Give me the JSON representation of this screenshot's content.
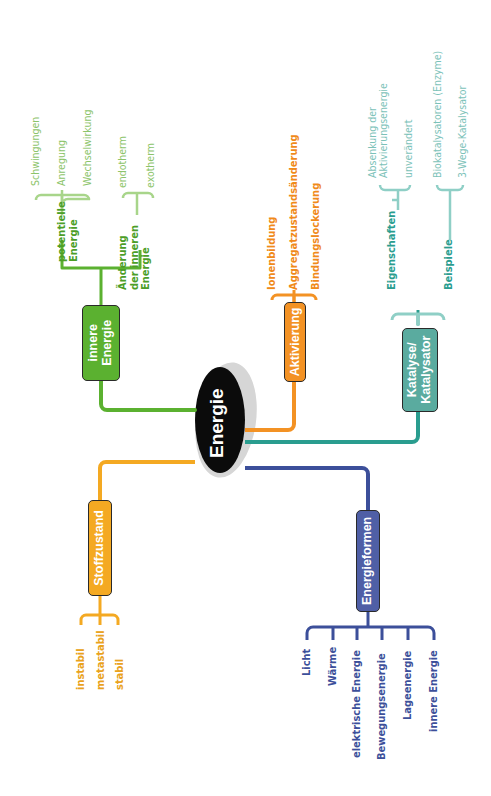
{
  "diagram": {
    "type": "mindmap",
    "orientation": "rotated-90-ccw",
    "center": {
      "label": "Energie",
      "color": "#111111"
    },
    "colors": {
      "innere_energie": "#5bb130",
      "innere_energie_light": "#a8d58a",
      "aktivierung": "#f39224",
      "stoffzustand": "#f4a922",
      "katalyse": "#2a9d8f",
      "katalyse_light": "#8fcfc6",
      "energieformen": "#3c4f9a"
    },
    "branches": [
      {
        "label": "innere Energie",
        "color": "#5bb130",
        "children": [
          {
            "label": "potentielle Energie",
            "children": [
              "Schwingungen",
              "Anregung",
              "Wechselwirkung"
            ]
          },
          {
            "label": "Änderung der inneren Energie",
            "children": [
              "endotherm",
              "exotherm"
            ]
          }
        ]
      },
      {
        "label": "Aktivierung",
        "color": "#f39224",
        "children": [
          {
            "label": "Ionenbildung"
          },
          {
            "label": "Aggregatzustandsänderung"
          },
          {
            "label": "Bindungslockerung"
          }
        ]
      },
      {
        "label": "Katalyse/ Katalysator",
        "color": "#2a9d8f",
        "children": [
          {
            "label": "Eigenschaften",
            "children": [
              "Absenkung der Aktivierungsenergie",
              "unverändert"
            ]
          },
          {
            "label": "Beispiele",
            "children": [
              "Biokatalysatoren (Enzyme)",
              "3-Wege-Katalysator"
            ]
          }
        ]
      },
      {
        "label": "Stoffzustand",
        "color": "#f4a922",
        "children": [
          {
            "label": "instabil"
          },
          {
            "label": "metastabil"
          },
          {
            "label": "stabil"
          }
        ]
      },
      {
        "label": "Energieformen",
        "color": "#3c4f9a",
        "children": [
          {
            "label": "Licht"
          },
          {
            "label": "Wärme"
          },
          {
            "label": "elektrische Energie"
          },
          {
            "label": "Bewegungsenergie"
          },
          {
            "label": "Lageenergie"
          },
          {
            "label": "innere Energie"
          }
        ]
      }
    ]
  },
  "labels": {
    "center": "Energie",
    "innere_box_1": "innere",
    "innere_box_2": "Energie",
    "potentielle_1": "potentielle",
    "potentielle_2": "Energie",
    "schwingungen": "Schwingungen",
    "anregung": "Anregung",
    "wechselwirkung": "Wechselwirkung",
    "aenderung_1": "Änderung",
    "aenderung_2": "der inneren",
    "aenderung_3": "Energie",
    "endotherm": "endotherm",
    "exotherm": "exotherm",
    "aktivierung_box": "Aktivierung",
    "ionenbildung": "Ionenbildung",
    "aggregat": "Aggregatzustandsänderung",
    "bindung": "Bindungslockerung",
    "katalyse_box_1": "Katalyse/",
    "katalyse_box_2": "Katalysator",
    "eigenschaften": "Eigenschaften",
    "absenkung_1": "Absenkung der",
    "absenkung_2": "Aktivierungsenergie",
    "unveraendert": "unverändert",
    "beispiele": "Beispiele",
    "biokatalysatoren": "Biokatalysatoren (Enzyme)",
    "dreiwege": "3-Wege-Katalysator",
    "stoffzustand_box": "Stoffzustand",
    "instabil": "instabil",
    "metastabil": "metastabil",
    "stabil": "stabil",
    "energieformen_box": "Energieformen",
    "licht": "Licht",
    "waerme": "Wärme",
    "elektrisch": "elektrische Energie",
    "bewegung": "Bewegungsenergie",
    "lage": "Lageenergie",
    "innere_e": "innere Energie"
  }
}
